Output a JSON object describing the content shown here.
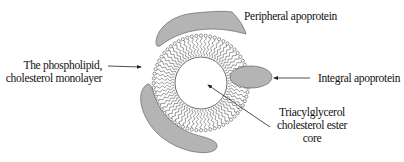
{
  "diagram": {
    "type": "lipoprotein structure",
    "labels": {
      "peripheral": "Peripheral apoprotein",
      "monolayer_line1": "The phospholipid,",
      "monolayer_line2": "cholesterol monolayer",
      "integral": "Integral apoprotein",
      "core_line1": "Triacylglycerol",
      "core_line2": "cholesterol ester",
      "core_line3": "core"
    },
    "colors": {
      "protein_fill": "#b4b4b4",
      "stroke": "#333333",
      "background": "#ffffff"
    },
    "geometry": {
      "center": [
        201,
        83
      ],
      "outer_radius": 49,
      "inner_radius": 26,
      "lipid_count": 64
    }
  }
}
